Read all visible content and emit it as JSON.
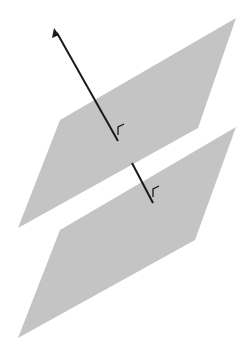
{
  "diagram": {
    "colors": {
      "plane_fill": "#c4c4c4",
      "line": "#1a1a1a",
      "background": "#ffffff"
    },
    "planes": [
      {
        "name": "upper-plane",
        "points": "236,18 198,128 18,228 60,120"
      },
      {
        "name": "lower-plane",
        "points": "236,127 195,240 18,338 60,230"
      }
    ],
    "normal_line": {
      "arrow_tip": [
        54,
        28
      ],
      "upper_segment_end": [
        118,
        141
      ],
      "lower_segment_start": [
        132,
        163
      ],
      "lower_segment_end": [
        153,
        203
      ]
    },
    "right_angle_marks": [
      {
        "name": "right-angle-upper",
        "path": "M118,135 L118,127 L124,124"
      },
      {
        "name": "right-angle-lower",
        "path": "M153,197 L153,189 L159,186"
      }
    ]
  }
}
